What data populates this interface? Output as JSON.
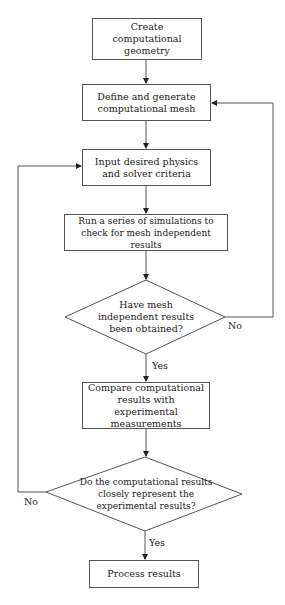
{
  "flowchart": {
    "nodes": [
      {
        "id": "create_geometry",
        "type": "process",
        "text": "Create computational geometry"
      },
      {
        "id": "define_mesh",
        "type": "process",
        "text": "Define and generate computational mesh"
      },
      {
        "id": "input_physics",
        "type": "process",
        "text": "Input desired physics and solver criteria"
      },
      {
        "id": "run_simulations",
        "type": "process",
        "text": "Run a series of simulations to check for mesh independent results"
      },
      {
        "id": "mesh_independent_decision",
        "type": "decision",
        "text": "Have mesh independent results been obtained?"
      },
      {
        "id": "compare_results",
        "type": "process",
        "text": "Compare computational results with experimental measurements"
      },
      {
        "id": "represent_decision",
        "type": "decision",
        "text": "Do the computational results closely represent the experimental results?"
      },
      {
        "id": "process_results",
        "type": "process",
        "text": "Process results"
      }
    ],
    "edges": [
      {
        "from": "create_geometry",
        "to": "define_mesh",
        "label": ""
      },
      {
        "from": "define_mesh",
        "to": "input_physics",
        "label": ""
      },
      {
        "from": "input_physics",
        "to": "run_simulations",
        "label": ""
      },
      {
        "from": "run_simulations",
        "to": "mesh_independent_decision",
        "label": ""
      },
      {
        "from": "mesh_independent_decision",
        "to": "compare_results",
        "label": "Yes"
      },
      {
        "from": "mesh_independent_decision",
        "to": "define_mesh",
        "label": "No"
      },
      {
        "from": "compare_results",
        "to": "represent_decision",
        "label": ""
      },
      {
        "from": "represent_decision",
        "to": "process_results",
        "label": "Yes"
      },
      {
        "from": "represent_decision",
        "to": "input_physics",
        "label": "No"
      }
    ],
    "labels": {
      "yes1": "Yes",
      "no1": "No",
      "yes2": "Yes",
      "no2": "No"
    }
  }
}
